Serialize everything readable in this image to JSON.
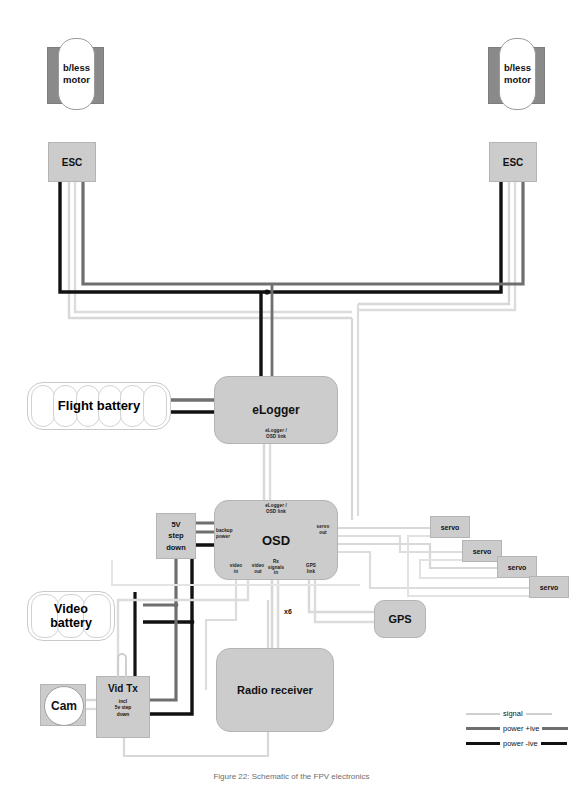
{
  "diagram": {
    "caption": "Figure 22: Schematic of the FPV electronics"
  },
  "colors": {
    "signal": "#cfcfcf",
    "power_positive": "#6f6f6f",
    "power_negative": "#111111",
    "box_fill": "#cccccc",
    "box_stroke": "#b4b4b4",
    "motor_mount": "#8a8a8a",
    "background": "#ffffff"
  },
  "nodes": {
    "motor_left": {
      "label": "b/less\nmotor"
    },
    "motor_right": {
      "label": "b/less\nmotor"
    },
    "esc_left": {
      "label": "ESC"
    },
    "esc_right": {
      "label": "ESC"
    },
    "flight_battery": {
      "label": "Flight battery",
      "cells": 6
    },
    "video_battery": {
      "label": "Video\nbattery",
      "cells": 3
    },
    "elogger": {
      "label": "eLogger"
    },
    "osd": {
      "label": "OSD"
    },
    "step_down": {
      "label": "5V\nstep\ndown"
    },
    "vid_tx": {
      "label": "Vid Tx",
      "sublabel": "incl\n5v step\ndown"
    },
    "cam": {
      "label": "Cam"
    },
    "gps": {
      "label": "GPS"
    },
    "radio_receiver": {
      "label": "Radio receiver"
    },
    "servo_1": {
      "label": "servo"
    },
    "servo_2": {
      "label": "servo"
    },
    "servo_3": {
      "label": "servo"
    },
    "servo_4": {
      "label": "servo"
    }
  },
  "port_labels": {
    "elogger_osd_link_top": "eLogger /\nOSD link",
    "elogger_osd_link_bottom": "eLogger /\nOSD link",
    "backup_power": "backup\npower",
    "servo_out": "servo\nout",
    "video_in": "video\nin",
    "video_out": "video\nout",
    "rx_signals_in": "Rx\nsignals\nin",
    "gps_link": "GPS\nlink"
  },
  "annotations": {
    "rx_channel_count": "x6"
  },
  "legend": {
    "items": [
      {
        "label": "signal",
        "key": "signal"
      },
      {
        "label": "power +ive",
        "key": "power_positive"
      },
      {
        "label": "power -ive",
        "key": "power_negative"
      }
    ]
  }
}
